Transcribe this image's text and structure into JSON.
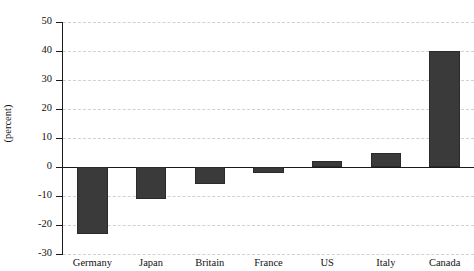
{
  "chart_data": {
    "type": "bar",
    "title": "",
    "xlabel": "",
    "ylabel": "(percent)",
    "categories": [
      "Germany",
      "Japan",
      "Britain",
      "France",
      "US",
      "Italy",
      "Canada"
    ],
    "values": [
      -23,
      -11,
      -6,
      -2,
      2,
      5,
      40
    ],
    "ylim": [
      -30,
      50
    ],
    "ytick_values": [
      50,
      40,
      30,
      20,
      10,
      0,
      -10,
      -20,
      -30
    ],
    "ytick_labels": [
      "50",
      "40",
      "30",
      "20",
      "10",
      "0",
      "-10",
      "-20",
      "-30"
    ],
    "grid": true,
    "legend": "none",
    "zero_line": true,
    "bar_color": "#3a3a3a",
    "grid_color": "#c9c9c9",
    "axis_color": "#1a1a1a"
  },
  "figure": {
    "clipped_title": ""
  }
}
